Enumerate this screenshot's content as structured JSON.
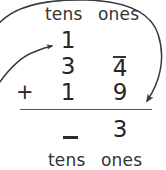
{
  "worksheet": {
    "header": {
      "tens_label": "tens",
      "ones_label": "ones"
    },
    "footer": {
      "tens_label": "tens",
      "ones_label": "ones"
    },
    "carry_row": {
      "tens": "1",
      "ones": ""
    },
    "addend_1": {
      "tens": "3",
      "ones": "4"
    },
    "addend_2": {
      "operator": "+",
      "tens": "1",
      "ones": "9"
    },
    "sum_row": {
      "tens": "–",
      "ones": "3"
    },
    "annotations": {
      "carry_arrow": "curved-arrow-to-carry",
      "regroup_arrow": "large-curved-arrow-ones-to-sum",
      "ones_overbar": "bar-above-four"
    },
    "colors": {
      "ink": "#262626",
      "label_ink": "#333333",
      "rule": "#555555",
      "arrow": "#3a3a3a",
      "paper": "#ffffff"
    }
  }
}
